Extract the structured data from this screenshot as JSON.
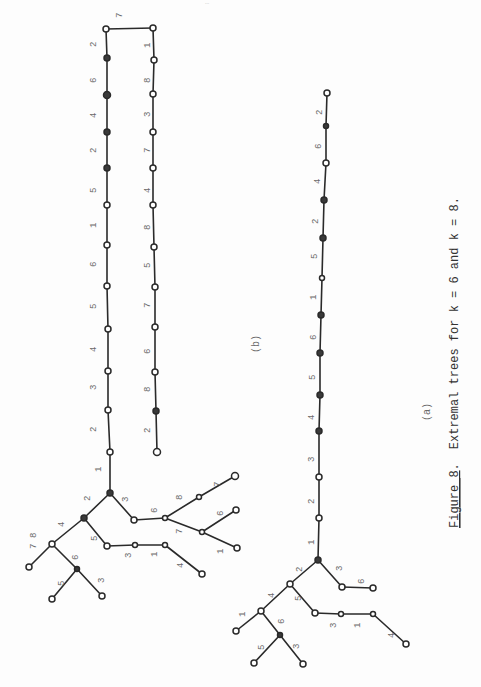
{
  "header": {
    "faint_text": "…"
  },
  "figure": {
    "label": "Figure 8",
    "label_suffix": ".",
    "caption_text": "Extremal trees for k = 6 and k = 8.",
    "subfigures": {
      "a": {
        "label": "(a)"
      },
      "b": {
        "label": "(b)"
      }
    }
  },
  "trees": {
    "b": {
      "left_path_labels": [
        "2",
        "6",
        "4",
        "2",
        "5",
        "1",
        "6",
        "5",
        "4",
        "3",
        "2",
        "1"
      ],
      "top_edge_label": "7",
      "right_path_labels": [
        "1",
        "8",
        "3",
        "7",
        "4",
        "8",
        "5",
        "7",
        "6",
        "8",
        "2"
      ],
      "branch_labels": {
        "root_to_left": "2",
        "root_to_right": "3",
        "left_to_leftleft": "4",
        "left_to_mid": "5",
        "leftleft_leaf": "7",
        "leftleft_leaf_alt": "8",
        "leftleft_to_sub": "6",
        "sub_leaf1": "5",
        "sub_leaf2": "3",
        "mid_chain": [
          "3",
          "1",
          "4"
        ],
        "right_chain": "6",
        "right_branch_up": "8",
        "right_branch_up_leaf": "7",
        "right_branch_down": "7",
        "right_down_leaf1": "6",
        "right_down_leaf2": "1"
      }
    },
    "a": {
      "path_labels": [
        "2",
        "6",
        "4",
        "2",
        "5",
        "1",
        "6",
        "5",
        "4",
        "3",
        "2",
        "1"
      ],
      "branch_labels": {
        "root_to_left": "2",
        "root_to_right": "3",
        "right_leaf": "6",
        "left_to_leftleft": "4",
        "left_to_mid": "5",
        "leftleft_leaf": "1",
        "leftleft_to_sub": "6",
        "sub_leaf1": "5",
        "sub_leaf2": "3",
        "mid_chain": [
          "3",
          "1",
          "4"
        ]
      }
    }
  }
}
